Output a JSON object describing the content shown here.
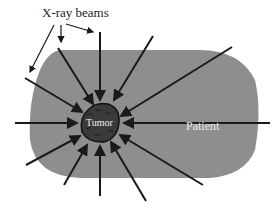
{
  "diagram": {
    "labels": {
      "beams": "X-ray beams",
      "tumor": "Tumor",
      "patient": "Patient"
    },
    "colors": {
      "patient_fill": "#8e8e8e",
      "tumor_fill": "#3a3a3a",
      "arrow": "#1a1a1a",
      "background": "#ffffff"
    },
    "beam_count": 12
  }
}
